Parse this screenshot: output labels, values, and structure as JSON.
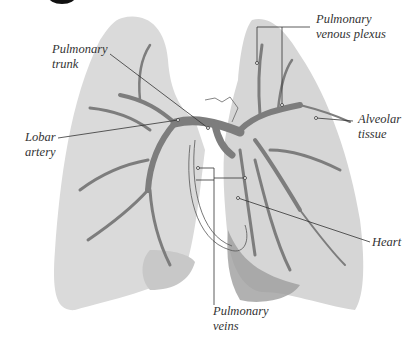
{
  "diagram": {
    "type": "anatomical-illustration",
    "colors": {
      "lung_fill": "#d9d9d9",
      "lung_shadow": "#bdbdbd",
      "vessel": "#7d7d7d",
      "leader_line": "#333333",
      "label_text": "#333333"
    },
    "labels": [
      {
        "id": "pulmonary-trunk",
        "line1": "Pulmonary",
        "line2": "trunk"
      },
      {
        "id": "pulmonary-venous-plexus",
        "line1": "Pulmonary",
        "line2": "venous plexus"
      },
      {
        "id": "lobar-artery",
        "line1": "Lobar",
        "line2": "artery"
      },
      {
        "id": "alveolar-tissue",
        "line1": "Alveolar",
        "line2": "tissue"
      },
      {
        "id": "heart",
        "line1": "Heart",
        "line2": ""
      },
      {
        "id": "pulmonary-veins",
        "line1": "Pulmonary",
        "line2": "veins"
      }
    ]
  }
}
